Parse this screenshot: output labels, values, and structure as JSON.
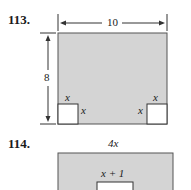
{
  "problems": [
    {
      "number": "113.",
      "figure": {
        "outer_width_label": "10",
        "outer_height_label": "8",
        "corner_cutout_label": "x",
        "fill_color": "#d4d4d4"
      },
      "labels": {
        "left_square_top": "x",
        "left_square_right": "x",
        "right_square_top": "x",
        "right_square_left": "x"
      }
    },
    {
      "number": "114.",
      "figure": {
        "outer_width_label": "4x",
        "inner_width_label": "x + 1",
        "fill_color": "#d4d4d4"
      }
    }
  ]
}
